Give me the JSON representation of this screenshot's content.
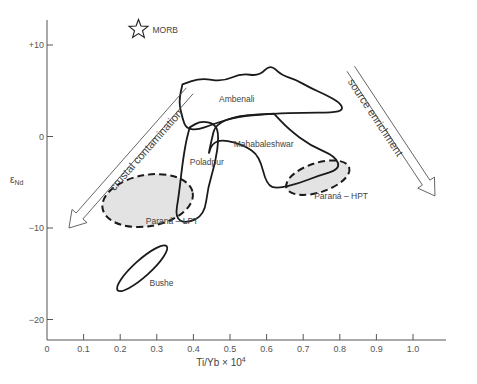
{
  "chart_data": {
    "type": "scatter",
    "title": "",
    "xlabel": "Ti/Yb × 10",
    "xlabel_superscript": "4",
    "ylabel": "ε",
    "ylabel_subscript": "Nd",
    "xlim": [
      0,
      1.1
    ],
    "ylim": [
      -22,
      13
    ],
    "grid": false,
    "x_ticks": [
      {
        "value": 0,
        "label": "0"
      },
      {
        "value": 0.1,
        "label": "0.1"
      },
      {
        "value": 0.2,
        "label": "0.2"
      },
      {
        "value": 0.3,
        "label": "0.3"
      },
      {
        "value": 0.4,
        "label": "0.4"
      },
      {
        "value": 0.5,
        "label": "0.5"
      },
      {
        "value": 0.6,
        "label": "0.6"
      },
      {
        "value": 0.7,
        "label": "0.7"
      },
      {
        "value": 0.8,
        "label": "0.8"
      },
      {
        "value": 0.9,
        "label": "0.9"
      },
      {
        "value": 1.0,
        "label": "1.0"
      }
    ],
    "y_ticks": [
      {
        "value": 10,
        "label": "+10"
      },
      {
        "value": 0,
        "label": "0"
      },
      {
        "value": -10,
        "label": "−10"
      },
      {
        "value": -20,
        "label": "−20"
      }
    ],
    "points": [
      {
        "name": "MORB",
        "x": 0.25,
        "y": 11.7,
        "marker": "star",
        "label": "MORB"
      }
    ],
    "fields": [
      {
        "name": "Ambenali",
        "label": "Ambenali",
        "style": "solid",
        "fill": false,
        "label_at": [
          0.47,
          3.8
        ],
        "outline": [
          [
            0.37,
            5.7
          ],
          [
            0.42,
            6.4
          ],
          [
            0.48,
            6.0
          ],
          [
            0.53,
            6.9
          ],
          [
            0.58,
            6.6
          ],
          [
            0.61,
            7.9
          ],
          [
            0.64,
            6.7
          ],
          [
            0.68,
            6.2
          ],
          [
            0.72,
            5.3
          ],
          [
            0.76,
            4.6
          ],
          [
            0.8,
            3.7
          ],
          [
            0.81,
            2.9
          ],
          [
            0.78,
            2.6
          ],
          [
            0.7,
            2.6
          ],
          [
            0.62,
            2.5
          ],
          [
            0.52,
            2.2
          ],
          [
            0.45,
            1.3
          ],
          [
            0.41,
            0.7
          ],
          [
            0.38,
            0.9
          ],
          [
            0.37,
            2.0
          ],
          [
            0.36,
            3.8
          ],
          [
            0.37,
            5.7
          ]
        ]
      },
      {
        "name": "Mahabaleshwar",
        "label": "Mahabaleshwar",
        "style": "solid",
        "fill": false,
        "label_at": [
          0.51,
          -1.1
        ],
        "outline": [
          [
            0.62,
            2.5
          ],
          [
            0.66,
            0.8
          ],
          [
            0.72,
            -1.0
          ],
          [
            0.79,
            -2.2
          ],
          [
            0.8,
            -3.6
          ],
          [
            0.74,
            -4.3
          ],
          [
            0.69,
            -5.1
          ],
          [
            0.63,
            -5.7
          ],
          [
            0.6,
            -5.3
          ],
          [
            0.58,
            -2.1
          ],
          [
            0.54,
            -1.0
          ],
          [
            0.48,
            -0.3
          ],
          [
            0.45,
            -0.8
          ],
          [
            0.44,
            -2.2
          ],
          [
            0.45,
            -0.3
          ],
          [
            0.46,
            1.3
          ],
          [
            0.52,
            2.3
          ],
          [
            0.62,
            2.5
          ]
        ]
      },
      {
        "name": "Poladpur",
        "label": "Poladpur",
        "style": "solid",
        "fill": false,
        "label_at": [
          0.39,
          -3.1
        ],
        "outline": [
          [
            0.39,
            1.0
          ],
          [
            0.42,
            1.7
          ],
          [
            0.46,
            1.4
          ],
          [
            0.47,
            0.0
          ],
          [
            0.46,
            -2.9
          ],
          [
            0.44,
            -5.5
          ],
          [
            0.43,
            -8.6
          ],
          [
            0.38,
            -9.5
          ],
          [
            0.35,
            -8.9
          ],
          [
            0.36,
            -6.5
          ],
          [
            0.37,
            -3.0
          ],
          [
            0.38,
            -0.5
          ],
          [
            0.39,
            1.0
          ]
        ]
      },
      {
        "name": "Parana-LPT",
        "label": "Paraná – LPT",
        "style": "dashed",
        "fill": true,
        "label_at": [
          0.27,
          -9.6
        ],
        "ellipse": {
          "cx": 0.275,
          "cy": -7.0,
          "rx": 0.125,
          "ry": 2.8,
          "rotate_deg": -10
        }
      },
      {
        "name": "Parana-HPT",
        "label": "Paraná – HPT",
        "style": "dashed",
        "fill": true,
        "label_at": [
          0.73,
          -6.8
        ],
        "ellipse": {
          "cx": 0.74,
          "cy": -4.5,
          "rx": 0.09,
          "ry": 1.6,
          "rotate_deg": -18
        }
      },
      {
        "name": "Bushe",
        "label": "Bushe",
        "style": "solid",
        "fill": false,
        "label_at": [
          0.28,
          -16.3
        ],
        "ellipse": {
          "cx": 0.26,
          "cy": -14.4,
          "rx": 0.09,
          "ry": 0.9,
          "rotate_deg": -42
        }
      }
    ],
    "annotations": [
      {
        "name": "crustal-contamination-arrow",
        "text": "crustal contamination",
        "from": [
          0.39,
          5.0
        ],
        "to": [
          0.06,
          -10.0
        ]
      },
      {
        "name": "source-enrichment-arrow",
        "text": "source enrichment",
        "from": [
          0.83,
          7.4
        ],
        "to": [
          1.06,
          -6.5
        ]
      }
    ]
  }
}
